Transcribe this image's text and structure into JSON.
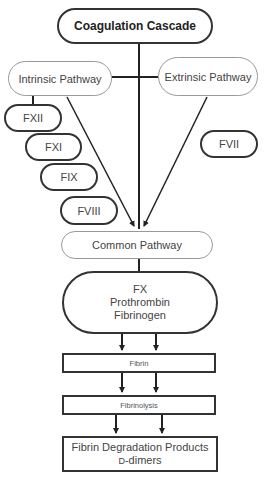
{
  "diagram": {
    "title": "Coagulation Cascade",
    "pathways": {
      "intrinsic": "Intrinsic Pathway",
      "extrinsic": "Extrinsic Pathway",
      "common": "Common Pathway"
    },
    "intrinsic_factors": [
      "FXII",
      "FXI",
      "FIX",
      "FVIII"
    ],
    "extrinsic_factors": [
      "FVII"
    ],
    "common_factors": [
      "FX",
      "Prothrombin",
      "Fibrinogen"
    ],
    "steps": {
      "fibrin": "Fibrin",
      "fibrinolysis": "Fibrinolysis",
      "products_line1": "Fibrin Degradation Products",
      "products_line2_prefix": "D",
      "products_line2_suffix": "-dimers"
    },
    "colors": {
      "dark_border": "#333333",
      "light_border": "#999999",
      "text": "#444444"
    }
  }
}
